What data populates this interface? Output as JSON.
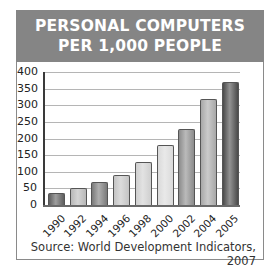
{
  "chart_data": {
    "type": "bar",
    "title": "PERSONAL COMPUTERS PER 1,000 PEOPLE",
    "title_lines": [
      "PERSONAL COMPUTERS",
      "PER 1,000 PEOPLE"
    ],
    "categories": [
      "1990",
      "1992",
      "1994",
      "1996",
      "1998",
      "2000",
      "2002",
      "2004",
      "2005"
    ],
    "values": [
      35,
      52,
      70,
      90,
      130,
      180,
      230,
      320,
      370
    ],
    "xlabel": "",
    "ylabel": "",
    "ylim": [
      0,
      400
    ],
    "yticks": [
      "400",
      "350",
      "300",
      "250",
      "200",
      "150",
      "100",
      "50",
      "0"
    ],
    "grid": true,
    "legend": null,
    "source": "Source: World Development Indicators, 2007",
    "bar_colors": [
      "#5e5e5e",
      "#b8b8b8",
      "#7a7a7a",
      "#c4c4c4",
      "#cfcfcf",
      "#dadada",
      "#8c8c8c",
      "#a8a8a8",
      "#4a4a4a"
    ]
  },
  "header": {
    "background": "#858585"
  }
}
